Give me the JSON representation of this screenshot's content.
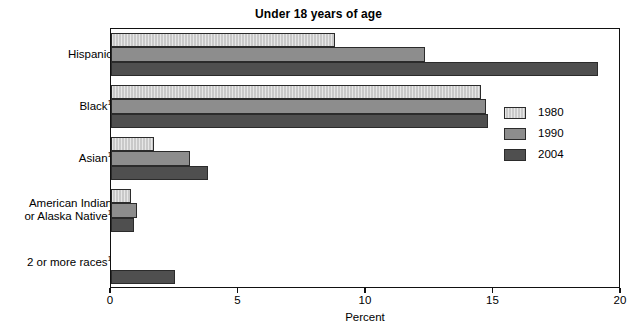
{
  "chart_data": {
    "type": "bar",
    "orientation": "horizontal",
    "title": "Under 18 years of age",
    "xlabel": "Percent",
    "ylabel": "",
    "xlim": [
      0,
      20
    ],
    "xticks": [
      0,
      5,
      10,
      15,
      20
    ],
    "xticklabels": [
      "0",
      "5",
      "10",
      "15",
      "20"
    ],
    "grid": false,
    "legend_position": "center right",
    "categories": [
      "Hispanic",
      "Black",
      "Asian",
      "American Indian or Alaska Native",
      "2 or more races"
    ],
    "category_labels": [
      {
        "line1": "Hispanic",
        "line2": "",
        "footnote": ""
      },
      {
        "line1": "Black",
        "line2": "",
        "footnote": "1"
      },
      {
        "line1": "Asian",
        "line2": "",
        "footnote": "1"
      },
      {
        "line1": "American Indian",
        "line2": "or Alaska Native",
        "footnote": "1"
      },
      {
        "line1": "2 or more races",
        "line2": "",
        "footnote": "1"
      }
    ],
    "series": [
      {
        "name": "1980",
        "color": "#c9c9c9",
        "values": [
          8.8,
          14.5,
          1.7,
          0.8,
          null
        ]
      },
      {
        "name": "1990",
        "color": "#8d8d8d",
        "values": [
          12.3,
          14.7,
          3.1,
          1.0,
          null
        ]
      },
      {
        "name": "2004",
        "color": "#4f4f4f",
        "values": [
          19.1,
          14.8,
          3.8,
          0.9,
          2.5
        ]
      }
    ]
  },
  "legend": {
    "entries": [
      {
        "label": "1980"
      },
      {
        "label": "1990"
      },
      {
        "label": "2004"
      }
    ]
  },
  "axis": {
    "x_title": "Percent",
    "tick_labels": [
      "0",
      "5",
      "10",
      "15",
      "20"
    ]
  },
  "title": "Under 18 years of age"
}
